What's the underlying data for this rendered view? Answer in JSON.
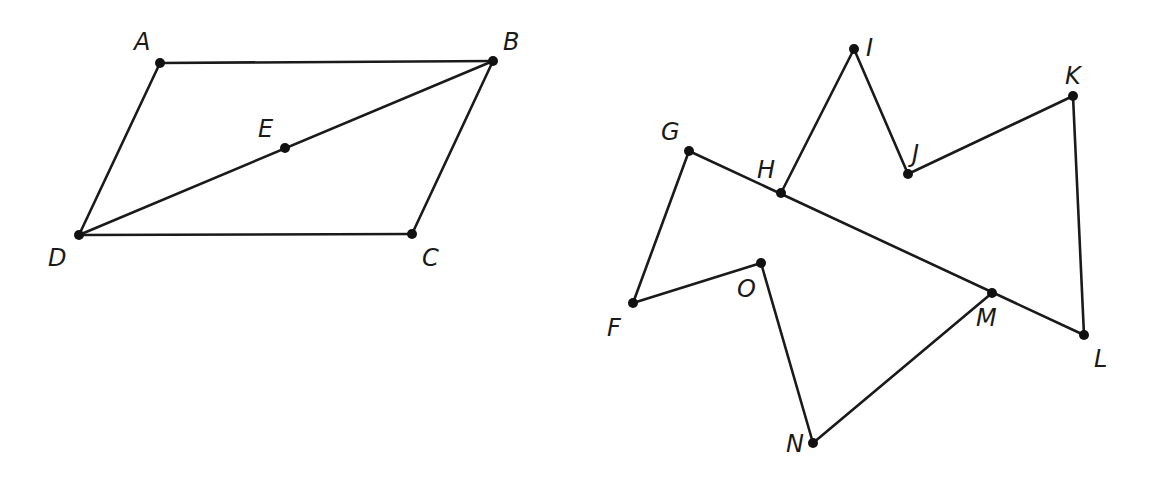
{
  "figures": [
    {
      "name": "parallelogram-ABCD",
      "points": {
        "A": {
          "x": 160,
          "y": 63,
          "lx": 134,
          "ly": 50
        },
        "B": {
          "x": 493,
          "y": 61,
          "lx": 503,
          "ly": 50
        },
        "C": {
          "x": 412,
          "y": 234,
          "lx": 422,
          "ly": 266
        },
        "D": {
          "x": 79,
          "y": 235,
          "lx": 48,
          "ly": 266
        },
        "E": {
          "x": 285,
          "y": 148,
          "lx": 258,
          "ly": 137
        }
      },
      "segments": [
        [
          "A",
          "B"
        ],
        [
          "B",
          "C"
        ],
        [
          "C",
          "D"
        ],
        [
          "D",
          "A"
        ],
        [
          "D",
          "B"
        ]
      ]
    },
    {
      "name": "polygon-FGHIJKLMNO",
      "points": {
        "F": {
          "x": 633,
          "y": 303,
          "lx": 607,
          "ly": 336
        },
        "G": {
          "x": 689,
          "y": 151,
          "lx": 661,
          "ly": 140
        },
        "H": {
          "x": 781,
          "y": 193,
          "lx": 757,
          "ly": 178
        },
        "I": {
          "x": 854,
          "y": 49,
          "lx": 866,
          "ly": 56
        },
        "J": {
          "x": 908,
          "y": 174,
          "lx": 912,
          "ly": 162
        },
        "K": {
          "x": 1073,
          "y": 96,
          "lx": 1065,
          "ly": 84
        },
        "L": {
          "x": 1084,
          "y": 335,
          "lx": 1094,
          "ly": 367
        },
        "M": {
          "x": 992,
          "y": 293,
          "lx": 976,
          "ly": 326
        },
        "N": {
          "x": 813,
          "y": 443,
          "lx": 786,
          "ly": 452
        },
        "O": {
          "x": 761,
          "y": 263,
          "lx": 737,
          "ly": 297
        }
      },
      "segments": [
        [
          "F",
          "G"
        ],
        [
          "G",
          "L"
        ],
        [
          "H",
          "I"
        ],
        [
          "I",
          "J"
        ],
        [
          "J",
          "K"
        ],
        [
          "K",
          "L"
        ],
        [
          "M",
          "N"
        ],
        [
          "N",
          "O"
        ],
        [
          "O",
          "F"
        ]
      ]
    }
  ],
  "style": {
    "stroke": "#1a1a1a",
    "point": "#111111",
    "background": "#ffffff"
  }
}
